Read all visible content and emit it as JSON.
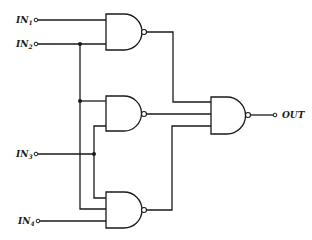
{
  "diagram": {
    "type": "logic-circuit",
    "inputs": [
      {
        "id": "IN1",
        "base": "IN",
        "sub": "1"
      },
      {
        "id": "IN2",
        "base": "IN",
        "sub": "2"
      },
      {
        "id": "IN3",
        "base": "IN",
        "sub": "3"
      },
      {
        "id": "IN4",
        "base": "IN",
        "sub": "4"
      }
    ],
    "output": {
      "id": "OUT",
      "label": "OUT"
    },
    "gates": [
      {
        "id": "G1",
        "type": "NAND",
        "inputs": [
          "IN1",
          "IN2"
        ]
      },
      {
        "id": "G2",
        "type": "NAND",
        "inputs": [
          "IN2",
          "IN3"
        ]
      },
      {
        "id": "G3",
        "type": "NAND",
        "inputs": [
          "IN3",
          "IN2",
          "IN4"
        ]
      },
      {
        "id": "G4",
        "type": "NAND",
        "inputs": [
          "G1",
          "G2",
          "G3"
        ],
        "drives": "OUT"
      }
    ],
    "colors": {
      "line": "#1a1a1a",
      "background": "#ffffff"
    }
  }
}
